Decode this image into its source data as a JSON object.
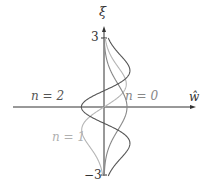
{
  "axes": {
    "vertical_label": "ξ",
    "horizontal_label": "ŵ",
    "tick_top": "3",
    "tick_bottom": "−3"
  },
  "curves": [
    {
      "label": "n = 0",
      "color": "#888888",
      "n": 0
    },
    {
      "label": "n = 1",
      "color": "#b5b5b5",
      "n": 1
    },
    {
      "label": "n = 2",
      "color": "#555555",
      "n": 2
    }
  ],
  "colors": {
    "axis": "#333333",
    "text_dark": "#555555",
    "text_light": "#b0b0b0"
  }
}
